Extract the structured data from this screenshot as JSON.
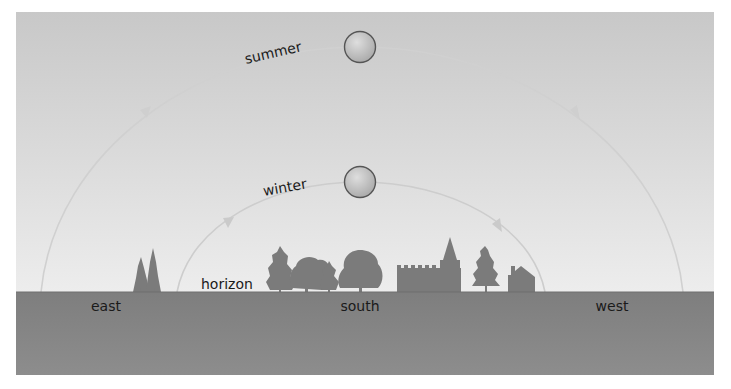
{
  "diagram": {
    "type": "sun-path",
    "colors": {
      "sky_top": "#c9c9c9",
      "sky_bottom": "#ececec",
      "ground": "#828282",
      "ground_bottom": "#8c8c8c",
      "silhouette": "#7d7d7d",
      "arc": "#d2d2d2",
      "sun_fill": "#bdbdbd",
      "sun_stroke": "#555555",
      "text": "#1a1a1a"
    },
    "paths": [
      {
        "name": "summer",
        "label": "summer",
        "start_x": 41,
        "peak_x": 360,
        "peak_y": 47,
        "end_x": 683,
        "horizon_y": 292
      },
      {
        "name": "winter",
        "label": "winter",
        "start_x": 177,
        "peak_x": 360,
        "peak_y": 182,
        "end_x": 545,
        "horizon_y": 292
      }
    ],
    "labels": {
      "horizon": "horizon",
      "east": "east",
      "south": "south",
      "west": "west"
    },
    "landmarks": [
      "conifer-pair",
      "tree-cluster",
      "church",
      "pine-tree",
      "house"
    ]
  }
}
